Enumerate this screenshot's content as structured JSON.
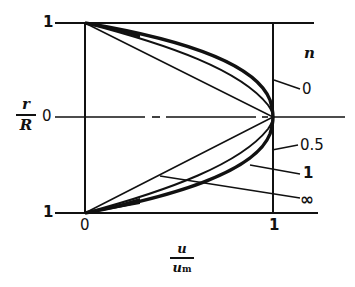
{
  "diagram": {
    "y_axis": {
      "label_numerator": "r",
      "label_denominator": "R",
      "ticks": [
        "1",
        "0",
        "1"
      ]
    },
    "x_axis": {
      "label_numerator": "u",
      "label_denominator": "u",
      "label_denominator_sub": "m",
      "ticks": [
        "0",
        "1"
      ]
    },
    "legend_title": "n",
    "curves": [
      {
        "n": "0",
        "label": "0"
      },
      {
        "n": "0.5",
        "label": "0.5"
      },
      {
        "n": "1",
        "label": "1"
      },
      {
        "n": "infinity",
        "label": "∞"
      }
    ],
    "colors": {
      "ink": "#111111",
      "background": "#ffffff"
    }
  }
}
